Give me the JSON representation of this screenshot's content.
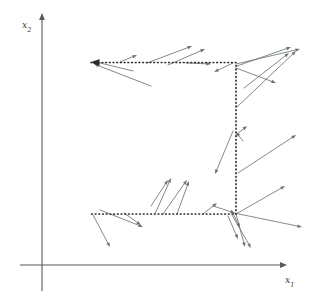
{
  "figure": {
    "background": "#ffffff",
    "width": 320,
    "height": 305
  },
  "axes": {
    "x_axis": {
      "name": "x1",
      "label_main": "x",
      "label_sub": "1",
      "label_x": 285,
      "label_y": 283,
      "color": "#555a5e",
      "x_start": 20,
      "x_end": 287,
      "y": 265
    },
    "y_axis": {
      "name": "x2",
      "label_main": "x",
      "label_sub": "2",
      "label_x": 22,
      "label_y": 28,
      "color": "#555a5e",
      "x": 42,
      "y_start": 291,
      "y_end": 13
    }
  },
  "dotted_path": {
    "name": "feasible-region-boundary",
    "color": "#2b2b2b",
    "dash": "0.6 3.1",
    "stroke_width": 1.7,
    "arrow_at_start": true,
    "points": [
      {
        "x": 91,
        "y": 62.5
      },
      {
        "x": 236,
        "y": 62.5
      },
      {
        "x": 236,
        "y": 214
      },
      {
        "x": 91,
        "y": 214
      }
    ]
  },
  "chart_data": {
    "type": "scatter",
    "title": "",
    "xlabel": "x1",
    "ylabel": "x2",
    "grid": false,
    "legend": null,
    "vectors": [
      {
        "x1": 133,
        "y1": 71,
        "x2": 92,
        "y2": 61
      },
      {
        "x1": 151,
        "y1": 86,
        "x2": 94,
        "y2": 64
      },
      {
        "x1": 120,
        "y1": 62,
        "x2": 137,
        "y2": 55
      },
      {
        "x1": 147,
        "y1": 63,
        "x2": 192,
        "y2": 46
      },
      {
        "x1": 168,
        "y1": 65,
        "x2": 205,
        "y2": 49
      },
      {
        "x1": 186,
        "y1": 63,
        "x2": 211,
        "y2": 64
      },
      {
        "x1": 233,
        "y1": 63,
        "x2": 214,
        "y2": 72
      },
      {
        "x1": 236,
        "y1": 64,
        "x2": 300,
        "y2": 49
      },
      {
        "x1": 237,
        "y1": 66,
        "x2": 291,
        "y2": 47
      },
      {
        "x1": 236,
        "y1": 68,
        "x2": 276,
        "y2": 83
      },
      {
        "x1": 244,
        "y1": 88,
        "x2": 289,
        "y2": 53
      },
      {
        "x1": 237,
        "y1": 107,
        "x2": 296,
        "y2": 51
      },
      {
        "x1": 236,
        "y1": 135,
        "x2": 247,
        "y2": 126
      },
      {
        "x1": 243,
        "y1": 141,
        "x2": 236,
        "y2": 132
      },
      {
        "x1": 233,
        "y1": 131,
        "x2": 215,
        "y2": 174
      },
      {
        "x1": 238,
        "y1": 173,
        "x2": 296,
        "y2": 135
      },
      {
        "x1": 236,
        "y1": 214,
        "x2": 285,
        "y2": 186
      },
      {
        "x1": 234,
        "y1": 213,
        "x2": 302,
        "y2": 227
      },
      {
        "x1": 151,
        "y1": 206,
        "x2": 168,
        "y2": 180
      },
      {
        "x1": 155,
        "y1": 214,
        "x2": 171,
        "y2": 178
      },
      {
        "x1": 163,
        "y1": 214,
        "x2": 187,
        "y2": 180
      },
      {
        "x1": 177,
        "y1": 214,
        "x2": 189,
        "y2": 181
      },
      {
        "x1": 203,
        "y1": 214,
        "x2": 217,
        "y2": 203
      },
      {
        "x1": 213,
        "y1": 206,
        "x2": 235,
        "y2": 213
      },
      {
        "x1": 232,
        "y1": 211,
        "x2": 240,
        "y2": 228
      },
      {
        "x1": 236,
        "y1": 214,
        "x2": 245,
        "y2": 247
      },
      {
        "x1": 232,
        "y1": 215,
        "x2": 251,
        "y2": 248
      },
      {
        "x1": 228,
        "y1": 216,
        "x2": 238,
        "y2": 239
      },
      {
        "x1": 100,
        "y1": 210,
        "x2": 143,
        "y2": 227
      },
      {
        "x1": 93,
        "y1": 215,
        "x2": 110,
        "y2": 247
      },
      {
        "x1": 124,
        "y1": 213,
        "x2": 141,
        "y2": 225
      }
    ],
    "series": [
      {
        "name": "gradient-arrows",
        "count": 31,
        "color": "#6d7275"
      }
    ]
  }
}
